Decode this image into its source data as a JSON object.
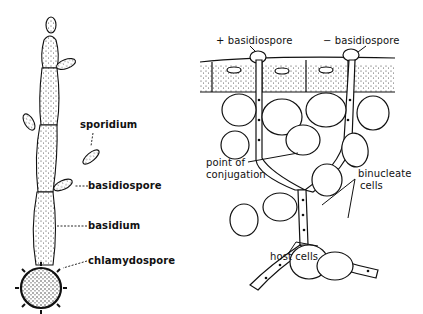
{
  "figure": {
    "left_panel": {
      "name": "smut fungus basidium germinating from chlamydospore",
      "labels": {
        "sporidium": "sporidium",
        "basidiospore": "basidiospore",
        "basidium": "basidium",
        "chlamydospore": "chlamydospore"
      }
    },
    "right_panel": {
      "name": "basidiospore infection and conjugation in host tissue",
      "labels": {
        "plus_basidiospore": "+ basidiospore",
        "minus_basidiospore": "− basidiospore",
        "point_of_conjugation_line1": "point of",
        "point_of_conjugation_line2": "conjugation",
        "binucleate_line1": "binucleate",
        "binucleate_line2": "cells",
        "host_cells": "host cells"
      }
    },
    "colors": {
      "ink": "#111111",
      "background": "#ffffff",
      "stipple": "#333333"
    }
  }
}
